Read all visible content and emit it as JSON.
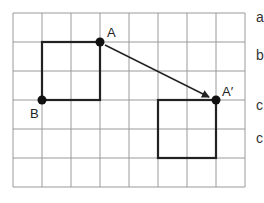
{
  "diagram": {
    "type": "grid-translation",
    "grid": {
      "columns": 8,
      "rows": 6,
      "cell_px": 29,
      "origin_px": [
        13,
        13
      ],
      "line_color": "#9a9a9a"
    },
    "original_square": {
      "top_left": [
        1,
        1
      ],
      "size": 2,
      "stroke": "#222222"
    },
    "image_square": {
      "top_left": [
        5,
        3
      ],
      "size": 2,
      "stroke": "#222222"
    },
    "points": [
      {
        "name": "A",
        "grid": [
          3,
          1
        ],
        "label": "A"
      },
      {
        "name": "B",
        "grid": [
          1,
          3
        ],
        "label": "B"
      },
      {
        "name": "A-prime",
        "grid": [
          7,
          3
        ],
        "label": "A′"
      }
    ],
    "arrow": {
      "from": "A",
      "to": "A′"
    }
  },
  "side_options": [
    "a",
    "b",
    "c",
    "c"
  ]
}
